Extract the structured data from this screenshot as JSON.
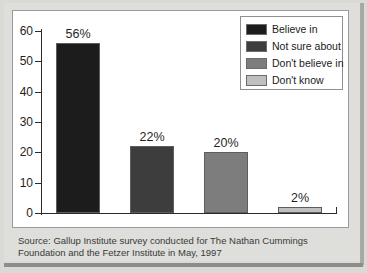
{
  "chart_data": {
    "type": "bar",
    "title": "",
    "xlabel": "",
    "ylabel": "",
    "ylim": [
      0,
      60
    ],
    "ytick_labels": [
      "60",
      "50",
      "40",
      "30",
      "20",
      "10",
      "0"
    ],
    "ytick_values": [
      60,
      50,
      40,
      30,
      20,
      10,
      0
    ],
    "grid": false,
    "legend_position": "top-right",
    "categories": [
      "Believe in",
      "Not sure about",
      "Don't believe in",
      "Don't know"
    ],
    "values": [
      56,
      22,
      20,
      2
    ],
    "data_labels": [
      "56%",
      "22%",
      "20%",
      "2%"
    ],
    "colors": [
      "#1c1c1c",
      "#3d3d3d",
      "#7d7d7d",
      "#bfbfbf"
    ],
    "bars": [
      {
        "label": "Believe in",
        "value": 56,
        "data_label": "56%",
        "color": "#1c1c1c"
      },
      {
        "label": "Not sure about",
        "value": 22,
        "data_label": "22%",
        "color": "#3d3d3d"
      },
      {
        "label": "Don't believe in",
        "value": 20,
        "data_label": "20%",
        "color": "#7d7d7d"
      },
      {
        "label": "Don't know",
        "value": 2,
        "data_label": "2%",
        "color": "#bfbfbf"
      }
    ]
  },
  "legend": {
    "items": [
      {
        "label": "Believe in",
        "color": "#1c1c1c"
      },
      {
        "label": "Not sure about",
        "color": "#3d3d3d"
      },
      {
        "label": "Don't believe in",
        "color": "#7d7d7d"
      },
      {
        "label": "Don't know",
        "color": "#bfbfbf"
      }
    ]
  },
  "source_note": {
    "line1": "Source: Gallup Institute survey conducted for The Nathan Cummings",
    "line2": "Foundation and the Fetzer Institute in May, 1997"
  }
}
